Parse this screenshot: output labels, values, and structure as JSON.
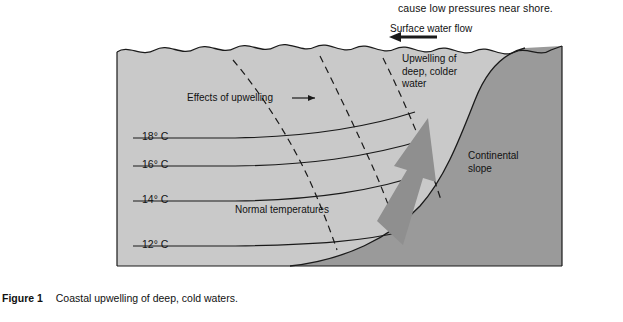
{
  "page": {
    "top_partial_sentence": "cause low pressures near shore.",
    "caption_label": "Figure 1",
    "caption_text": "Coastal upwelling of deep, cold waters."
  },
  "diagram": {
    "title": "Coastal upwelling of deep, cold waters",
    "labels": {
      "surface_flow": "Surface water flow",
      "upwelling_arrow": "Upwelling of\ndeep, colder\nwater",
      "effects": "Effects of upwelling",
      "normal_temps": "Normal temperatures",
      "continental_slope": "Continental\nslope",
      "upwelling_line1": "Upwelling of",
      "upwelling_line2": "deep, colder",
      "upwelling_line3": "water",
      "slope_line1": "Continental",
      "slope_line2": "slope"
    },
    "isotherms": [
      {
        "label": "18° C"
      },
      {
        "label": "16° C"
      },
      {
        "label": "14° C"
      },
      {
        "label": "12° C"
      }
    ],
    "colors": {
      "water_fill": "#c9c9c9",
      "slope_fill": "#9a9a9a",
      "arrow_fill": "#8f8f8f",
      "line": "#1a1a1a",
      "background": "#ffffff"
    }
  }
}
